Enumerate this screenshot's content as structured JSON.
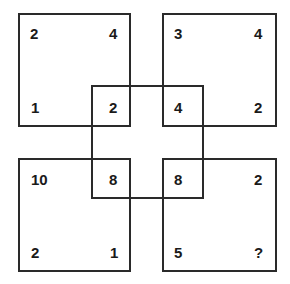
{
  "puzzle": {
    "squares": {
      "top_left": {
        "tl": "2",
        "tr": "4",
        "bl": "1",
        "br": "2"
      },
      "top_right": {
        "tl": "3",
        "tr": "4",
        "bl": "4",
        "br": "2"
      },
      "bottom_left": {
        "tl": "10",
        "tr": "8",
        "bl": "2",
        "br": "1"
      },
      "bottom_right": {
        "tl": "8",
        "tr": "2",
        "bl": "5",
        "br": "?"
      }
    },
    "line_color": "#2a2a2a",
    "text_color": "#1a1a1a"
  }
}
